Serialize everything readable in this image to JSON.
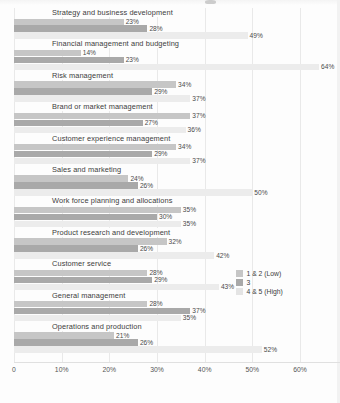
{
  "chart_data": {
    "type": "bar",
    "orientation": "horizontal",
    "title": "",
    "xlabel": "",
    "ylabel": "",
    "xlim": [
      0,
      60
    ],
    "grid": true,
    "legend_position": "right",
    "tick_labels": [
      "0",
      "10%",
      "20%",
      "30%",
      "40%",
      "50%",
      "60%"
    ],
    "tick_values": [
      0,
      10,
      20,
      30,
      40,
      50,
      60
    ],
    "categories": [
      "Strategy and business development",
      "Financial management and budgeting",
      "Risk management",
      "Brand or market management",
      "Customer experience management",
      "Sales and marketing",
      "Work force planning and allocations",
      "Product research and development",
      "Customer service",
      "General management",
      "Operations and production"
    ],
    "series": [
      {
        "name": "1 & 2 (Low)",
        "color": "#c6c6c6",
        "values": [
          23,
          14,
          34,
          37,
          34,
          24,
          35,
          32,
          28,
          28,
          21
        ],
        "labels": [
          "23%",
          "14%",
          "34%",
          "37%",
          "34%",
          "24%",
          "35%",
          "32%",
          "28%",
          "28%",
          "21%"
        ]
      },
      {
        "name": "3",
        "color": "#a9a9a9",
        "values": [
          28,
          23,
          29,
          27,
          29,
          26,
          30,
          26,
          29,
          37,
          26
        ],
        "labels": [
          "28%",
          "23%",
          "29%",
          "27%",
          "29%",
          "26%",
          "30%",
          "26%",
          "29%",
          "37%",
          "26%"
        ]
      },
      {
        "name": "4 & 5 (High)",
        "color": "#ececec",
        "values": [
          49,
          64,
          37,
          36,
          37,
          50,
          35,
          42,
          43,
          35,
          52
        ],
        "labels": [
          "49%",
          "64%",
          "37%",
          "36%",
          "37%",
          "50%",
          "35%",
          "42%",
          "43%",
          "35%",
          "52%"
        ]
      }
    ]
  },
  "legend": {
    "items": [
      {
        "label": "1 & 2 (Low)"
      },
      {
        "label": "3"
      },
      {
        "label": "4 & 5 (High)"
      }
    ]
  }
}
